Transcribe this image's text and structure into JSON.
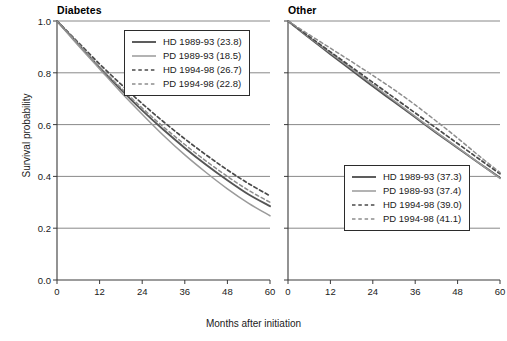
{
  "figure": {
    "ylabel": "Survival probability",
    "xlabel": "Months after initiation"
  },
  "axis": {
    "yticks": [
      "0.0",
      "0.2",
      "0.4",
      "0.6",
      "0.8",
      "1.0"
    ],
    "xticks": [
      "0",
      "12",
      "24",
      "36",
      "48",
      "60"
    ]
  },
  "chart_data": {
    "type": "line",
    "title": "",
    "xlabel": "Months after initiation",
    "ylabel": "Survival probability",
    "xlim": [
      0,
      60
    ],
    "ylim": [
      0,
      1
    ],
    "grid": "horizontal-gridlines-at-0.2-0.4-0.6-0.8-1.0",
    "legend_position": "left panel: upper-right inside; right panel: lower-right inside",
    "panels": [
      {
        "name": "Diabetes",
        "title": "Diabetes",
        "legend_position": "upper-right",
        "x": [
          0,
          6,
          12,
          18,
          24,
          30,
          36,
          42,
          48,
          54,
          60
        ],
        "series": [
          {
            "name": "HD 1989-93 (23.8)",
            "label": "HD 1989-93",
            "value": "23.8",
            "style": "solid",
            "color": "#555555",
            "width": 1.9,
            "values": [
              1.0,
              0.91,
              0.82,
              0.735,
              0.655,
              0.58,
              0.51,
              0.445,
              0.385,
              0.33,
              0.285
            ]
          },
          {
            "name": "PD 1989-93 (18.5)",
            "label": "PD 1989-93",
            "value": "18.5",
            "style": "solid",
            "color": "#9a9a9a",
            "width": 1.5,
            "values": [
              1.0,
              0.905,
              0.815,
              0.725,
              0.64,
              0.558,
              0.483,
              0.415,
              0.352,
              0.296,
              0.248
            ]
          },
          {
            "name": "HD 1994-98 (26.7)",
            "label": "HD 1994-98",
            "value": "26.7",
            "style": "dashed",
            "color": "#4a4a4a",
            "width": 1.7,
            "values": [
              1.0,
              0.917,
              0.834,
              0.756,
              0.681,
              0.611,
              0.545,
              0.483,
              0.425,
              0.372,
              0.325
            ]
          },
          {
            "name": "PD 1994-98 (22.8)",
            "label": "PD 1994-98",
            "value": "22.8",
            "style": "dashed",
            "color": "#8d8d8d",
            "width": 1.5,
            "values": [
              1.0,
              0.912,
              0.824,
              0.742,
              0.664,
              0.591,
              0.523,
              0.459,
              0.4,
              0.346,
              0.3
            ]
          }
        ]
      },
      {
        "name": "Other",
        "title": "Other",
        "legend_position": "lower-right",
        "x": [
          0,
          6,
          12,
          18,
          24,
          30,
          36,
          42,
          48,
          54,
          60
        ],
        "series": [
          {
            "name": "HD 1989-93 (37.3)",
            "label": "HD 1989-93",
            "value": "37.3",
            "style": "solid",
            "color": "#555555",
            "width": 1.9,
            "values": [
              1.0,
              0.935,
              0.872,
              0.81,
              0.748,
              0.688,
              0.628,
              0.568,
              0.51,
              0.452,
              0.395
            ]
          },
          {
            "name": "PD 1989-93 (37.4)",
            "label": "PD 1989-93",
            "value": "37.4",
            "style": "solid",
            "color": "#9a9a9a",
            "width": 1.5,
            "values": [
              1.0,
              0.938,
              0.877,
              0.816,
              0.754,
              0.693,
              0.632,
              0.571,
              0.512,
              0.452,
              0.392
            ]
          },
          {
            "name": "HD 1994-98 (39.0)",
            "label": "HD 1994-98",
            "value": "39.0",
            "style": "dashed",
            "color": "#4a4a4a",
            "width": 1.7,
            "values": [
              1.0,
              0.94,
              0.881,
              0.822,
              0.763,
              0.704,
              0.645,
              0.586,
              0.527,
              0.468,
              0.41
            ]
          },
          {
            "name": "PD 1994-98 (41.1)",
            "label": "PD 1994-98",
            "value": "41.1",
            "style": "dashed",
            "color": "#8d8d8d",
            "width": 1.5,
            "values": [
              1.0,
              0.947,
              0.895,
              0.843,
              0.79,
              0.735,
              0.676,
              0.613,
              0.548,
              0.48,
              0.415
            ]
          }
        ]
      }
    ]
  }
}
